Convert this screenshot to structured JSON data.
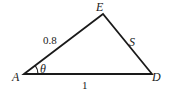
{
  "diagram": {
    "type": "triangle",
    "vertices": {
      "A": {
        "label": "A",
        "x": 24,
        "y": 74
      },
      "E": {
        "label": "E",
        "x": 103,
        "y": 14
      },
      "D": {
        "label": "D",
        "x": 152,
        "y": 74
      }
    },
    "sides": {
      "AE": {
        "label": "0.8"
      },
      "ED": {
        "label": "S"
      },
      "AD": {
        "label": "1"
      }
    },
    "angle": {
      "vertex": "A",
      "label": "θ"
    },
    "stroke_color": "#1a1a1a"
  }
}
